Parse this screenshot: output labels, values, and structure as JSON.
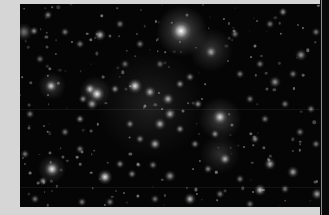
{
  "image": {
    "subject": "star cluster",
    "frame_color": "#d6d6d6",
    "sky_color": "#050505",
    "photo_box": {
      "left": 20,
      "top": 4,
      "width": 309,
      "height": 203
    }
  },
  "glows": [
    {
      "x": 162,
      "y": 27,
      "r": 26,
      "a": 0.35
    },
    {
      "x": 191,
      "y": 46,
      "r": 22,
      "a": 0.22
    },
    {
      "x": 200,
      "y": 115,
      "r": 22,
      "a": 0.25
    },
    {
      "x": 200,
      "y": 150,
      "r": 20,
      "a": 0.18
    },
    {
      "x": 130,
      "y": 100,
      "r": 55,
      "a": 0.12
    },
    {
      "x": 32,
      "y": 82,
      "r": 14,
      "a": 0.25
    },
    {
      "x": 75,
      "y": 88,
      "r": 16,
      "a": 0.25
    },
    {
      "x": 32,
      "y": 165,
      "r": 14,
      "a": 0.25
    }
  ],
  "stars": [
    {
      "x": 161,
      "y": 27,
      "s": 7,
      "b": 1.0
    },
    {
      "x": 191,
      "y": 48,
      "s": 4,
      "b": 0.6
    },
    {
      "x": 14,
      "y": 27,
      "s": 3,
      "b": 0.6
    },
    {
      "x": 28,
      "y": 11,
      "s": 3,
      "b": 0.55
    },
    {
      "x": 45,
      "y": 28,
      "s": 3,
      "b": 0.5
    },
    {
      "x": 80,
      "y": 31,
      "s": 4,
      "b": 0.75
    },
    {
      "x": 60,
      "y": 40,
      "s": 3,
      "b": 0.5
    },
    {
      "x": 100,
      "y": 20,
      "s": 3,
      "b": 0.5
    },
    {
      "x": 120,
      "y": 40,
      "s": 3,
      "b": 0.5
    },
    {
      "x": 4,
      "y": 28,
      "s": 6,
      "b": 0.45
    },
    {
      "x": 31,
      "y": 82,
      "s": 4,
      "b": 0.8
    },
    {
      "x": 70,
      "y": 85,
      "s": 4,
      "b": 0.8
    },
    {
      "x": 77,
      "y": 90,
      "s": 5,
      "b": 0.95
    },
    {
      "x": 95,
      "y": 85,
      "s": 3,
      "b": 0.6
    },
    {
      "x": 63,
      "y": 95,
      "s": 3,
      "b": 0.55
    },
    {
      "x": 115,
      "y": 82,
      "s": 5,
      "b": 0.9
    },
    {
      "x": 130,
      "y": 88,
      "s": 4,
      "b": 0.7
    },
    {
      "x": 148,
      "y": 95,
      "s": 4,
      "b": 0.7
    },
    {
      "x": 160,
      "y": 80,
      "s": 3,
      "b": 0.6
    },
    {
      "x": 170,
      "y": 73,
      "s": 3,
      "b": 0.55
    },
    {
      "x": 178,
      "y": 100,
      "s": 3,
      "b": 0.6
    },
    {
      "x": 60,
      "y": 115,
      "s": 3,
      "b": 0.6
    },
    {
      "x": 72,
      "y": 100,
      "s": 4,
      "b": 0.65
    },
    {
      "x": 140,
      "y": 120,
      "s": 4,
      "b": 0.7
    },
    {
      "x": 150,
      "y": 110,
      "s": 4,
      "b": 0.7
    },
    {
      "x": 160,
      "y": 125,
      "s": 3,
      "b": 0.6
    },
    {
      "x": 120,
      "y": 135,
      "s": 3,
      "b": 0.55
    },
    {
      "x": 110,
      "y": 120,
      "s": 3,
      "b": 0.55
    },
    {
      "x": 135,
      "y": 140,
      "s": 4,
      "b": 0.7
    },
    {
      "x": 175,
      "y": 140,
      "s": 3,
      "b": 0.55
    },
    {
      "x": 200,
      "y": 113,
      "s": 5,
      "b": 0.85
    },
    {
      "x": 195,
      "y": 130,
      "s": 3,
      "b": 0.6
    },
    {
      "x": 205,
      "y": 155,
      "s": 4,
      "b": 0.7
    },
    {
      "x": 188,
      "y": 165,
      "s": 3,
      "b": 0.55
    },
    {
      "x": 235,
      "y": 135,
      "s": 3,
      "b": 0.6
    },
    {
      "x": 245,
      "y": 115,
      "s": 3,
      "b": 0.5
    },
    {
      "x": 230,
      "y": 95,
      "s": 3,
      "b": 0.5
    },
    {
      "x": 255,
      "y": 78,
      "s": 4,
      "b": 0.6
    },
    {
      "x": 240,
      "y": 60,
      "s": 3,
      "b": 0.5
    },
    {
      "x": 215,
      "y": 30,
      "s": 3,
      "b": 0.5
    },
    {
      "x": 250,
      "y": 20,
      "s": 3,
      "b": 0.5
    },
    {
      "x": 263,
      "y": 8,
      "s": 3,
      "b": 0.6
    },
    {
      "x": 220,
      "y": 70,
      "s": 3,
      "b": 0.5
    },
    {
      "x": 281,
      "y": 51,
      "s": 4,
      "b": 0.6
    },
    {
      "x": 296,
      "y": 28,
      "s": 3,
      "b": 0.5
    },
    {
      "x": 273,
      "y": 70,
      "s": 3,
      "b": 0.5
    },
    {
      "x": 265,
      "y": 100,
      "s": 3,
      "b": 0.5
    },
    {
      "x": 291,
      "y": 105,
      "s": 3,
      "b": 0.5
    },
    {
      "x": 280,
      "y": 128,
      "s": 3,
      "b": 0.5
    },
    {
      "x": 296,
      "y": 140,
      "s": 3,
      "b": 0.5
    },
    {
      "x": 250,
      "y": 160,
      "s": 4,
      "b": 0.7
    },
    {
      "x": 273,
      "y": 168,
      "s": 4,
      "b": 0.65
    },
    {
      "x": 297,
      "y": 190,
      "s": 4,
      "b": 0.65
    },
    {
      "x": 240,
      "y": 186,
      "s": 4,
      "b": 0.8
    },
    {
      "x": 265,
      "y": 185,
      "s": 3,
      "b": 0.5
    },
    {
      "x": 32,
      "y": 165,
      "s": 5,
      "b": 0.9
    },
    {
      "x": 23,
      "y": 177,
      "s": 3,
      "b": 0.6
    },
    {
      "x": 85,
      "y": 173,
      "s": 5,
      "b": 0.9
    },
    {
      "x": 112,
      "y": 170,
      "s": 3,
      "b": 0.55
    },
    {
      "x": 100,
      "y": 160,
      "s": 3,
      "b": 0.55
    },
    {
      "x": 133,
      "y": 161,
      "s": 3,
      "b": 0.5
    },
    {
      "x": 150,
      "y": 172,
      "s": 4,
      "b": 0.6
    },
    {
      "x": 170,
      "y": 195,
      "s": 4,
      "b": 0.75
    },
    {
      "x": 135,
      "y": 195,
      "s": 3,
      "b": 0.5
    },
    {
      "x": 90,
      "y": 198,
      "s": 3,
      "b": 0.5
    },
    {
      "x": 62,
      "y": 198,
      "s": 3,
      "b": 0.5
    },
    {
      "x": 15,
      "y": 195,
      "s": 3,
      "b": 0.5
    },
    {
      "x": 5,
      "y": 150,
      "s": 3,
      "b": 0.5
    },
    {
      "x": 60,
      "y": 145,
      "s": 3,
      "b": 0.5
    },
    {
      "x": 45,
      "y": 128,
      "s": 3,
      "b": 0.5
    },
    {
      "x": 10,
      "y": 110,
      "s": 3,
      "b": 0.5
    },
    {
      "x": 20,
      "y": 55,
      "s": 3,
      "b": 0.45
    },
    {
      "x": 140,
      "y": 60,
      "s": 3,
      "b": 0.45
    },
    {
      "x": 105,
      "y": 60,
      "s": 3,
      "b": 0.45
    },
    {
      "x": 200,
      "y": 190,
      "s": 3,
      "b": 0.5
    },
    {
      "x": 220,
      "y": 175,
      "s": 3,
      "b": 0.5
    },
    {
      "x": 230,
      "y": 200,
      "s": 3,
      "b": 0.45
    }
  ]
}
